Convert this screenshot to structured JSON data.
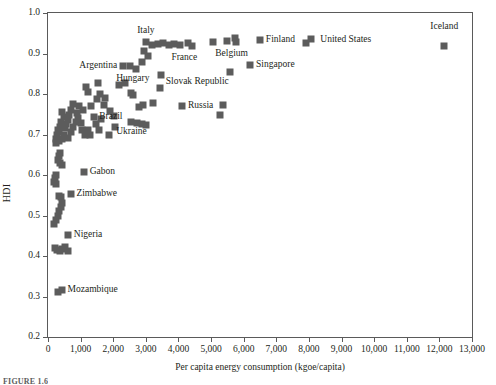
{
  "figure": {
    "caption": "FIGURE 1.6"
  },
  "chart_data": {
    "type": "scatter",
    "title": "",
    "xlabel": "Per capita energy consumption (kgoe/capita)",
    "ylabel": "HDI",
    "xlim": [
      0,
      13000
    ],
    "ylim": [
      0.2,
      1.0
    ],
    "xticks": [
      0,
      1000,
      2000,
      3000,
      4000,
      5000,
      6000,
      7000,
      8000,
      9000,
      10000,
      11000,
      12000,
      13000
    ],
    "xticklabels": [
      "0",
      "1,000",
      "2,000",
      "3,000",
      "4,000",
      "5,000",
      "6,000",
      "7,000",
      "8,000",
      "9,000",
      "10,000",
      "11,000",
      "12,000",
      "13,000"
    ],
    "yticks": [
      0.2,
      0.3,
      0.4,
      0.5,
      0.6,
      0.7,
      0.8,
      0.9,
      1.0
    ],
    "yticklabels": [
      "0.2",
      "0.3",
      "0.4",
      "0.5",
      "0.6",
      "0.7",
      "0.8",
      "0.9",
      "1.0"
    ],
    "grid": false,
    "legend": null,
    "marker_color": "#5c5c5c",
    "marker_shape": "square",
    "points": [
      {
        "x": 12150,
        "y": 0.918,
        "label": "Iceland",
        "label_pos": "above"
      },
      {
        "x": 8050,
        "y": 0.935,
        "label": "United States",
        "label_pos": "right"
      },
      {
        "x": 7900,
        "y": 0.925,
        "label": "",
        "label_pos": ""
      },
      {
        "x": 6500,
        "y": 0.934,
        "label": "Finland",
        "label_pos": "right"
      },
      {
        "x": 6200,
        "y": 0.872,
        "label": "Singapore",
        "label_pos": "right"
      },
      {
        "x": 5750,
        "y": 0.928,
        "label": "Belgium",
        "label_pos": "below"
      },
      {
        "x": 5500,
        "y": 0.932,
        "label": "",
        "label_pos": ""
      },
      {
        "x": 5730,
        "y": 0.938,
        "label": "",
        "label_pos": ""
      },
      {
        "x": 5050,
        "y": 0.928,
        "label": "",
        "label_pos": ""
      },
      {
        "x": 5570,
        "y": 0.855,
        "label": "",
        "label_pos": ""
      },
      {
        "x": 4420,
        "y": 0.918,
        "label": "France",
        "label_pos": "below"
      },
      {
        "x": 4300,
        "y": 0.925,
        "label": "",
        "label_pos": ""
      },
      {
        "x": 4050,
        "y": 0.922,
        "label": "",
        "label_pos": ""
      },
      {
        "x": 3850,
        "y": 0.923,
        "label": "",
        "label_pos": ""
      },
      {
        "x": 3700,
        "y": 0.922,
        "label": "",
        "label_pos": ""
      },
      {
        "x": 3520,
        "y": 0.925,
        "label": "",
        "label_pos": ""
      },
      {
        "x": 3380,
        "y": 0.924,
        "label": "",
        "label_pos": ""
      },
      {
        "x": 3180,
        "y": 0.922,
        "label": "",
        "label_pos": ""
      },
      {
        "x": 3010,
        "y": 0.928,
        "label": "Italy",
        "label_pos": "above"
      },
      {
        "x": 2930,
        "y": 0.905,
        "label": "",
        "label_pos": ""
      },
      {
        "x": 3060,
        "y": 0.893,
        "label": "",
        "label_pos": ""
      },
      {
        "x": 2870,
        "y": 0.878,
        "label": "",
        "label_pos": ""
      },
      {
        "x": 3450,
        "y": 0.848,
        "label": "Slovak Republic",
        "label_pos": "right"
      },
      {
        "x": 3420,
        "y": 0.815,
        "label": "",
        "label_pos": ""
      },
      {
        "x": 2700,
        "y": 0.862,
        "label": "Hungary",
        "label_pos": "below"
      },
      {
        "x": 2520,
        "y": 0.87,
        "label": "",
        "label_pos": ""
      },
      {
        "x": 2300,
        "y": 0.868,
        "label": "Argentina",
        "label_pos": "left"
      },
      {
        "x": 2350,
        "y": 0.828,
        "label": "",
        "label_pos": ""
      },
      {
        "x": 2180,
        "y": 0.823,
        "label": "",
        "label_pos": ""
      },
      {
        "x": 2550,
        "y": 0.803,
        "label": "",
        "label_pos": ""
      },
      {
        "x": 2620,
        "y": 0.797,
        "label": "",
        "label_pos": ""
      },
      {
        "x": 3210,
        "y": 0.778,
        "label": "",
        "label_pos": ""
      },
      {
        "x": 2900,
        "y": 0.772,
        "label": "",
        "label_pos": ""
      },
      {
        "x": 2800,
        "y": 0.768,
        "label": "",
        "label_pos": ""
      },
      {
        "x": 4120,
        "y": 0.77,
        "label": "Russia",
        "label_pos": "right"
      },
      {
        "x": 5380,
        "y": 0.772,
        "label": "",
        "label_pos": ""
      },
      {
        "x": 5270,
        "y": 0.748,
        "label": "",
        "label_pos": ""
      },
      {
        "x": 2560,
        "y": 0.732,
        "label": "Ukraine",
        "label_pos": "below"
      },
      {
        "x": 2720,
        "y": 0.729,
        "label": "",
        "label_pos": ""
      },
      {
        "x": 2870,
        "y": 0.726,
        "label": "",
        "label_pos": ""
      },
      {
        "x": 3010,
        "y": 0.723,
        "label": "",
        "label_pos": ""
      },
      {
        "x": 1400,
        "y": 0.742,
        "label": "Brazil",
        "label_pos": "right"
      },
      {
        "x": 1160,
        "y": 0.818,
        "label": "",
        "label_pos": ""
      },
      {
        "x": 1220,
        "y": 0.805,
        "label": "",
        "label_pos": ""
      },
      {
        "x": 1530,
        "y": 0.828,
        "label": "",
        "label_pos": ""
      },
      {
        "x": 1600,
        "y": 0.8,
        "label": "",
        "label_pos": ""
      },
      {
        "x": 1500,
        "y": 0.788,
        "label": "",
        "label_pos": ""
      },
      {
        "x": 1760,
        "y": 0.79,
        "label": "",
        "label_pos": ""
      },
      {
        "x": 1720,
        "y": 0.772,
        "label": "",
        "label_pos": ""
      },
      {
        "x": 1900,
        "y": 0.758,
        "label": "",
        "label_pos": ""
      },
      {
        "x": 2030,
        "y": 0.745,
        "label": "",
        "label_pos": ""
      },
      {
        "x": 2060,
        "y": 0.718,
        "label": "",
        "label_pos": ""
      },
      {
        "x": 1880,
        "y": 0.698,
        "label": "",
        "label_pos": ""
      },
      {
        "x": 1310,
        "y": 0.77,
        "label": "",
        "label_pos": ""
      },
      {
        "x": 1080,
        "y": 0.76,
        "label": "",
        "label_pos": ""
      },
      {
        "x": 950,
        "y": 0.77,
        "label": "",
        "label_pos": ""
      },
      {
        "x": 880,
        "y": 0.752,
        "label": "",
        "label_pos": ""
      },
      {
        "x": 780,
        "y": 0.775,
        "label": "",
        "label_pos": ""
      },
      {
        "x": 700,
        "y": 0.76,
        "label": "",
        "label_pos": ""
      },
      {
        "x": 640,
        "y": 0.748,
        "label": "",
        "label_pos": ""
      },
      {
        "x": 600,
        "y": 0.735,
        "label": "",
        "label_pos": ""
      },
      {
        "x": 560,
        "y": 0.725,
        "label": "",
        "label_pos": ""
      },
      {
        "x": 520,
        "y": 0.715,
        "label": "",
        "label_pos": ""
      },
      {
        "x": 480,
        "y": 0.742,
        "label": "",
        "label_pos": ""
      },
      {
        "x": 430,
        "y": 0.755,
        "label": "",
        "label_pos": ""
      },
      {
        "x": 400,
        "y": 0.73,
        "label": "",
        "label_pos": ""
      },
      {
        "x": 370,
        "y": 0.718,
        "label": "",
        "label_pos": ""
      },
      {
        "x": 340,
        "y": 0.705,
        "label": "",
        "label_pos": ""
      },
      {
        "x": 300,
        "y": 0.712,
        "label": "",
        "label_pos": ""
      },
      {
        "x": 280,
        "y": 0.698,
        "label": "",
        "label_pos": ""
      },
      {
        "x": 260,
        "y": 0.688,
        "label": "",
        "label_pos": ""
      },
      {
        "x": 240,
        "y": 0.678,
        "label": "",
        "label_pos": ""
      },
      {
        "x": 330,
        "y": 0.683,
        "label": "",
        "label_pos": ""
      },
      {
        "x": 420,
        "y": 0.69,
        "label": "",
        "label_pos": ""
      },
      {
        "x": 500,
        "y": 0.7,
        "label": "",
        "label_pos": ""
      },
      {
        "x": 620,
        "y": 0.692,
        "label": "",
        "label_pos": ""
      },
      {
        "x": 700,
        "y": 0.705,
        "label": "",
        "label_pos": ""
      },
      {
        "x": 760,
        "y": 0.718,
        "label": "",
        "label_pos": ""
      },
      {
        "x": 850,
        "y": 0.73,
        "label": "",
        "label_pos": ""
      },
      {
        "x": 920,
        "y": 0.74,
        "label": "",
        "label_pos": ""
      },
      {
        "x": 1000,
        "y": 0.728,
        "label": "",
        "label_pos": ""
      },
      {
        "x": 1050,
        "y": 0.712,
        "label": "",
        "label_pos": ""
      },
      {
        "x": 1130,
        "y": 0.7,
        "label": "",
        "label_pos": ""
      },
      {
        "x": 1230,
        "y": 0.712,
        "label": "",
        "label_pos": ""
      },
      {
        "x": 1300,
        "y": 0.698,
        "label": "",
        "label_pos": ""
      },
      {
        "x": 1480,
        "y": 0.725,
        "label": "",
        "label_pos": ""
      },
      {
        "x": 1560,
        "y": 0.712,
        "label": "",
        "label_pos": ""
      },
      {
        "x": 1640,
        "y": 0.738,
        "label": "",
        "label_pos": ""
      },
      {
        "x": 380,
        "y": 0.655,
        "label": "",
        "label_pos": ""
      },
      {
        "x": 330,
        "y": 0.648,
        "label": "",
        "label_pos": ""
      },
      {
        "x": 300,
        "y": 0.638,
        "label": "",
        "label_pos": ""
      },
      {
        "x": 360,
        "y": 0.63,
        "label": "",
        "label_pos": ""
      },
      {
        "x": 420,
        "y": 0.625,
        "label": "",
        "label_pos": ""
      },
      {
        "x": 1100,
        "y": 0.607,
        "label": "Gabon",
        "label_pos": "right"
      },
      {
        "x": 250,
        "y": 0.6,
        "label": "",
        "label_pos": ""
      },
      {
        "x": 210,
        "y": 0.592,
        "label": "",
        "label_pos": ""
      },
      {
        "x": 180,
        "y": 0.582,
        "label": "",
        "label_pos": ""
      },
      {
        "x": 260,
        "y": 0.578,
        "label": "",
        "label_pos": ""
      },
      {
        "x": 700,
        "y": 0.552,
        "label": "Zimbabwe",
        "label_pos": "right"
      },
      {
        "x": 330,
        "y": 0.548,
        "label": "",
        "label_pos": ""
      },
      {
        "x": 390,
        "y": 0.545,
        "label": "",
        "label_pos": ""
      },
      {
        "x": 430,
        "y": 0.532,
        "label": "",
        "label_pos": ""
      },
      {
        "x": 400,
        "y": 0.52,
        "label": "",
        "label_pos": ""
      },
      {
        "x": 350,
        "y": 0.51,
        "label": "",
        "label_pos": ""
      },
      {
        "x": 300,
        "y": 0.498,
        "label": "",
        "label_pos": ""
      },
      {
        "x": 230,
        "y": 0.488,
        "label": "",
        "label_pos": ""
      },
      {
        "x": 180,
        "y": 0.478,
        "label": "",
        "label_pos": ""
      },
      {
        "x": 620,
        "y": 0.452,
        "label": "Nigeria",
        "label_pos": "right"
      },
      {
        "x": 210,
        "y": 0.42,
        "label": "",
        "label_pos": ""
      },
      {
        "x": 280,
        "y": 0.415,
        "label": "",
        "label_pos": ""
      },
      {
        "x": 360,
        "y": 0.412,
        "label": "",
        "label_pos": ""
      },
      {
        "x": 440,
        "y": 0.418,
        "label": "",
        "label_pos": ""
      },
      {
        "x": 530,
        "y": 0.422,
        "label": "",
        "label_pos": ""
      },
      {
        "x": 600,
        "y": 0.412,
        "label": "",
        "label_pos": ""
      },
      {
        "x": 420,
        "y": 0.315,
        "label": "Mozambique",
        "label_pos": "right"
      },
      {
        "x": 300,
        "y": 0.31,
        "label": "",
        "label_pos": ""
      }
    ],
    "annotations": [
      {
        "text": "Iceland",
        "x": 12150,
        "y": 0.965,
        "align": "center"
      },
      {
        "text": "United States",
        "x": 8350,
        "y": 0.933,
        "align": "left"
      },
      {
        "text": "Finland",
        "x": 6680,
        "y": 0.933,
        "align": "left"
      },
      {
        "text": "Belgium",
        "x": 5630,
        "y": 0.898,
        "align": "center"
      },
      {
        "text": "Singapore",
        "x": 6380,
        "y": 0.871,
        "align": "left"
      },
      {
        "text": "France",
        "x": 4180,
        "y": 0.89,
        "align": "center"
      },
      {
        "text": "Italy",
        "x": 3000,
        "y": 0.955,
        "align": "center"
      },
      {
        "text": "Slovak Republic",
        "x": 3610,
        "y": 0.83,
        "align": "left"
      },
      {
        "text": "Hungary",
        "x": 2600,
        "y": 0.838,
        "align": "center"
      },
      {
        "text": "Argentina",
        "x": 2120,
        "y": 0.868,
        "align": "right"
      },
      {
        "text": "Russia",
        "x": 4290,
        "y": 0.77,
        "align": "left"
      },
      {
        "text": "Ukraine",
        "x": 2560,
        "y": 0.707,
        "align": "center"
      },
      {
        "text": "Brazil",
        "x": 1570,
        "y": 0.742,
        "align": "left"
      },
      {
        "text": "Gabon",
        "x": 1280,
        "y": 0.607,
        "align": "left"
      },
      {
        "text": "Zimbabwe",
        "x": 870,
        "y": 0.552,
        "align": "left"
      },
      {
        "text": "Nigeria",
        "x": 790,
        "y": 0.452,
        "align": "left"
      },
      {
        "text": "Mozambique",
        "x": 600,
        "y": 0.315,
        "align": "left"
      }
    ]
  }
}
